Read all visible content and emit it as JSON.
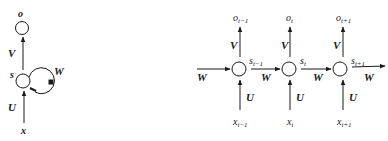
{
  "folded": {
    "output": "o",
    "state": "s",
    "input": "x",
    "weight_out": "V",
    "weight_in": "U",
    "weight_rec": "W"
  },
  "unfolded": {
    "weight_rec": "W",
    "steps": [
      {
        "output": "o",
        "output_sub": "t−1",
        "state": "s",
        "state_sub": "t−1",
        "input": "x",
        "input_sub": "t−1",
        "weight_out": "V",
        "weight_in": "U",
        "weight_rec": "W"
      },
      {
        "output": "o",
        "output_sub": "t",
        "state": "s",
        "state_sub": "t",
        "input": "x",
        "input_sub": "t",
        "weight_out": "V",
        "weight_in": "U",
        "weight_rec": "W"
      },
      {
        "output": "o",
        "output_sub": "t+1",
        "state": "s",
        "state_sub": "t+1",
        "input": "x",
        "input_sub": "t+1",
        "weight_out": "V",
        "weight_in": "U",
        "weight_rec": "W"
      }
    ]
  },
  "colors": {
    "stroke": "#1a1a1a",
    "background": "#ffffff"
  }
}
